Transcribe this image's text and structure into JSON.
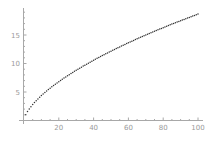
{
  "chart_data": {
    "type": "scatter",
    "title": "",
    "xlabel": "",
    "ylabel": "",
    "xlim": [
      0,
      100
    ],
    "ylim": [
      0,
      19.5
    ],
    "grid": false,
    "legend": null,
    "x_ticks": [
      20,
      40,
      60,
      80,
      100
    ],
    "y_ticks": [
      5,
      10,
      15
    ],
    "x_tick_labels": [
      "20",
      "40",
      "60",
      "80",
      "100"
    ],
    "y_tick_labels": [
      "5",
      "10",
      "15"
    ],
    "series": [
      {
        "name": "data",
        "marker": "dot",
        "color": "#333333",
        "x": [
          1,
          2,
          3,
          4,
          5,
          6,
          7,
          8,
          9,
          10,
          11,
          12,
          13,
          14,
          15,
          16,
          17,
          18,
          19,
          20,
          21,
          22,
          23,
          24,
          25,
          26,
          27,
          28,
          29,
          30,
          31,
          32,
          33,
          34,
          35,
          36,
          37,
          38,
          39,
          40,
          41,
          42,
          43,
          44,
          45,
          46,
          47,
          48,
          49,
          50,
          51,
          52,
          53,
          54,
          55,
          56,
          57,
          58,
          59,
          60,
          61,
          62,
          63,
          64,
          65,
          66,
          67,
          68,
          69,
          70,
          71,
          72,
          73,
          74,
          75,
          76,
          77,
          78,
          79,
          80,
          81,
          82,
          83,
          84,
          85,
          86,
          87,
          88,
          89,
          90,
          91,
          92,
          93,
          94,
          95,
          96,
          97,
          98,
          99,
          100
        ],
        "y": [
          1.0,
          1.56,
          2.02,
          2.43,
          2.8,
          3.15,
          3.47,
          3.79,
          4.08,
          4.37,
          4.64,
          4.9,
          5.17,
          5.42,
          5.66,
          5.9,
          6.13,
          6.36,
          6.58,
          6.8,
          7.02,
          7.23,
          7.44,
          7.64,
          7.84,
          8.04,
          8.24,
          8.43,
          8.62,
          8.81,
          8.99,
          9.18,
          9.36,
          9.54,
          9.71,
          9.89,
          10.06,
          10.23,
          10.4,
          10.57,
          10.74,
          10.9,
          11.06,
          11.23,
          11.39,
          11.54,
          11.7,
          11.86,
          12.01,
          12.16,
          12.32,
          12.47,
          12.62,
          12.76,
          12.91,
          13.06,
          13.2,
          13.35,
          13.49,
          13.63,
          13.77,
          13.91,
          14.05,
          14.19,
          14.33,
          14.46,
          14.6,
          14.73,
          14.87,
          15.0,
          15.13,
          15.26,
          15.39,
          15.52,
          15.65,
          15.78,
          15.91,
          16.04,
          16.16,
          16.29,
          16.41,
          16.54,
          16.66,
          16.78,
          16.91,
          17.03,
          17.15,
          17.27,
          17.39,
          17.51,
          17.63,
          17.74,
          17.86,
          17.98,
          18.09,
          18.21,
          18.33,
          18.44,
          18.55,
          18.67
        ]
      }
    ]
  },
  "colors": {
    "axis": "#a8a8a8",
    "tick_label": "#9a9a9a",
    "points": "#333333",
    "background": "#ffffff"
  }
}
